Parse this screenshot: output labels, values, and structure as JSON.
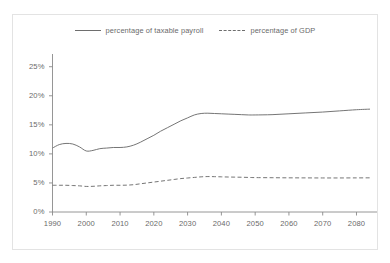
{
  "chart_data": {
    "type": "line",
    "title": "",
    "xlabel": "",
    "ylabel": "",
    "xlim": [
      1990,
      2084
    ],
    "ylim": [
      0,
      26.5
    ],
    "grid": false,
    "legend_position": "top-center",
    "y_ticks": [
      "0%",
      "5%",
      "10%",
      "15%",
      "20%",
      "25%"
    ],
    "y_tick_values": [
      0,
      5,
      10,
      15,
      20,
      25
    ],
    "x_ticks": [
      "1990",
      "2000",
      "2010",
      "2020",
      "2030",
      "2040",
      "2050",
      "2060",
      "2070",
      "2080"
    ],
    "x_tick_values": [
      1990,
      2000,
      2010,
      2020,
      2030,
      2040,
      2050,
      2060,
      2070,
      2080
    ],
    "x": [
      1990,
      1992,
      1994,
      1996,
      1998,
      2000,
      2002,
      2004,
      2006,
      2008,
      2010,
      2012,
      2014,
      2016,
      2018,
      2020,
      2022,
      2024,
      2026,
      2028,
      2030,
      2032,
      2034,
      2036,
      2038,
      2040,
      2042,
      2044,
      2046,
      2048,
      2050,
      2055,
      2060,
      2065,
      2070,
      2075,
      2080,
      2084
    ],
    "series": [
      {
        "name": "percentage of taxable payroll",
        "style": "solid",
        "color": "#6e6e6e",
        "values": [
          11.0,
          11.6,
          11.8,
          11.7,
          11.2,
          10.5,
          10.6,
          10.9,
          11.0,
          11.1,
          11.1,
          11.2,
          11.5,
          12.0,
          12.6,
          13.2,
          13.9,
          14.5,
          15.1,
          15.7,
          16.2,
          16.7,
          16.95,
          17.0,
          16.95,
          16.9,
          16.85,
          16.8,
          16.75,
          16.7,
          16.7,
          16.75,
          16.9,
          17.05,
          17.2,
          17.4,
          17.6,
          17.7
        ]
      },
      {
        "name": "percentage of GDP",
        "style": "dashed",
        "color": "#6e6e6e",
        "values": [
          4.6,
          4.6,
          4.6,
          4.55,
          4.5,
          4.4,
          4.42,
          4.5,
          4.55,
          4.6,
          4.6,
          4.62,
          4.7,
          4.85,
          5.0,
          5.15,
          5.3,
          5.45,
          5.6,
          5.75,
          5.85,
          5.95,
          6.05,
          6.1,
          6.08,
          6.05,
          6.02,
          6.0,
          5.98,
          5.95,
          5.92,
          5.9,
          5.88,
          5.87,
          5.86,
          5.86,
          5.87,
          5.88
        ]
      }
    ]
  },
  "legend": {
    "entries": [
      {
        "label": "percentage of taxable payroll",
        "style": "solid"
      },
      {
        "label": "percentage of GDP",
        "style": "dashed"
      }
    ]
  },
  "colors": {
    "line": "#6e6e6e",
    "axis": "#8a8a8a",
    "text": "#6a6a6a",
    "frame": "#e3e3e3",
    "background": "#ffffff"
  }
}
